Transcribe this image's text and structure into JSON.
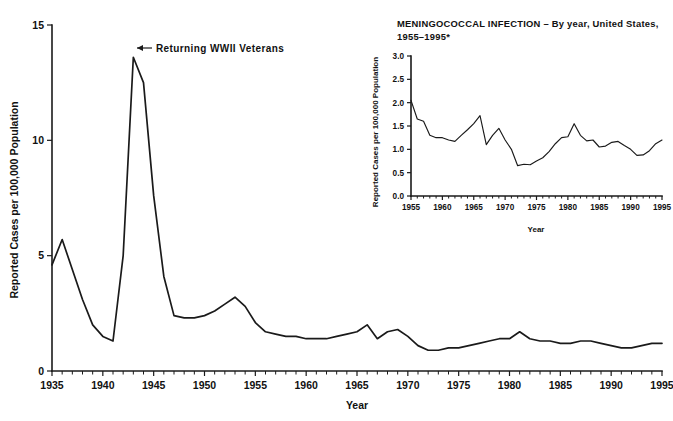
{
  "chart_data": [
    {
      "id": "main",
      "type": "line",
      "title": "",
      "xlabel": "Year",
      "ylabel": "Reported Cases per 100,000 Population",
      "xlim": [
        1935,
        1995
      ],
      "ylim": [
        0,
        15
      ],
      "yticks": [
        0,
        5,
        10,
        15
      ],
      "ytick_labels": [
        "0",
        "5",
        "10",
        "15"
      ],
      "xticks": [
        1935,
        1940,
        1945,
        1950,
        1955,
        1960,
        1965,
        1970,
        1975,
        1980,
        1985,
        1990,
        1995
      ],
      "xtick_labels": [
        "1935",
        "1940",
        "1945",
        "1950",
        "1955",
        "1960",
        "1965",
        "1970",
        "1975",
        "1980",
        "1985",
        "1990",
        "1995"
      ],
      "minor_tick_interval": 1,
      "grid": false,
      "legend": "none",
      "annotations": [
        {
          "text": "Returning WWII Veterans",
          "arrow": "←",
          "points_to_year": 1943,
          "points_to_value": 13.6
        }
      ],
      "x": [
        1935,
        1936,
        1937,
        1938,
        1939,
        1940,
        1941,
        1942,
        1943,
        1944,
        1945,
        1946,
        1947,
        1948,
        1949,
        1950,
        1951,
        1952,
        1953,
        1954,
        1955,
        1956,
        1957,
        1958,
        1959,
        1960,
        1961,
        1962,
        1963,
        1964,
        1965,
        1966,
        1967,
        1968,
        1969,
        1970,
        1971,
        1972,
        1973,
        1974,
        1975,
        1976,
        1977,
        1978,
        1979,
        1980,
        1981,
        1982,
        1983,
        1984,
        1985,
        1986,
        1987,
        1988,
        1989,
        1990,
        1991,
        1992,
        1993,
        1994,
        1995
      ],
      "values": [
        4.6,
        5.7,
        4.4,
        3.1,
        2.0,
        1.5,
        1.3,
        5.0,
        13.6,
        12.5,
        7.6,
        4.1,
        2.4,
        2.3,
        2.3,
        2.4,
        2.6,
        2.9,
        3.2,
        2.8,
        2.1,
        1.7,
        1.6,
        1.5,
        1.5,
        1.4,
        1.4,
        1.4,
        1.5,
        1.6,
        1.7,
        2.0,
        1.4,
        1.7,
        1.8,
        1.5,
        1.1,
        0.9,
        0.9,
        1.0,
        1.0,
        1.1,
        1.2,
        1.3,
        1.4,
        1.4,
        1.7,
        1.4,
        1.3,
        1.3,
        1.2,
        1.2,
        1.3,
        1.3,
        1.2,
        1.1,
        1.0,
        1.0,
        1.1,
        1.2,
        1.2
      ]
    },
    {
      "id": "inset",
      "type": "line",
      "title_line1": "MENINGOCOCCAL INFECTION  –  By year, United States,",
      "title_line2": "1955–1995*",
      "xlabel": "Year",
      "ylabel": "Reported Cases per 100,000 Population",
      "xlim": [
        1955,
        1995
      ],
      "ylim": [
        0.0,
        3.0
      ],
      "yticks": [
        0.0,
        0.5,
        1.0,
        1.5,
        2.0,
        2.5,
        3.0
      ],
      "ytick_labels": [
        "0.0",
        "0.5",
        "1.0",
        "1.5",
        "2.0",
        "2.5",
        "3.0"
      ],
      "xticks": [
        1955,
        1960,
        1965,
        1970,
        1975,
        1980,
        1985,
        1990,
        1995
      ],
      "xtick_labels": [
        "1955",
        "1960",
        "1965",
        "1970",
        "1975",
        "1980",
        "1985",
        "1990",
        "1995"
      ],
      "minor_tick_interval": 1,
      "grid": false,
      "legend": "none",
      "x": [
        1955,
        1956,
        1957,
        1958,
        1959,
        1960,
        1961,
        1962,
        1963,
        1964,
        1965,
        1966,
        1967,
        1968,
        1969,
        1970,
        1971,
        1972,
        1973,
        1974,
        1975,
        1976,
        1977,
        1978,
        1979,
        1980,
        1981,
        1982,
        1983,
        1984,
        1985,
        1986,
        1987,
        1988,
        1989,
        1990,
        1991,
        1992,
        1993,
        1994,
        1995
      ],
      "values": [
        2.05,
        1.65,
        1.6,
        1.3,
        1.25,
        1.25,
        1.2,
        1.17,
        1.3,
        1.42,
        1.55,
        1.72,
        1.1,
        1.3,
        1.45,
        1.2,
        1.0,
        0.65,
        0.68,
        0.67,
        0.75,
        0.82,
        0.95,
        1.12,
        1.25,
        1.27,
        1.55,
        1.3,
        1.18,
        1.2,
        1.05,
        1.07,
        1.15,
        1.17,
        1.08,
        1.0,
        0.87,
        0.88,
        0.97,
        1.12,
        1.2
      ]
    }
  ],
  "figure": {
    "background_color": "#ffffff",
    "line_color": "#1a1a1a"
  }
}
